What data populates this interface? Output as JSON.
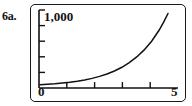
{
  "figure": {
    "problem_label": "6a."
  },
  "chart_data": {
    "type": "line",
    "title": "",
    "subtitle": "",
    "xlabel": "",
    "ylabel": "",
    "xlim": [
      0,
      5
    ],
    "ylim": [
      0,
      1000
    ],
    "grid": false,
    "legend": null,
    "annotations": [],
    "axis_labels": {
      "y_max": "1,000",
      "x_min": "0",
      "x_max": "5"
    },
    "x_ticks": [
      1,
      2,
      3,
      4
    ],
    "x_tick_labels": [
      "",
      "",
      "",
      ""
    ],
    "y_ticks": [
      200,
      400,
      600,
      800,
      1000
    ],
    "y_tick_labels": [
      "",
      "",
      "",
      "",
      "1,000"
    ],
    "series": [
      {
        "name": "exponential growth",
        "x": [
          0,
          0.25,
          0.5,
          0.75,
          1.0,
          1.25,
          1.5,
          1.75,
          2.0,
          2.25,
          2.5,
          2.75,
          3.0,
          3.25,
          3.5,
          3.75,
          4.0,
          4.15,
          4.3
        ],
        "values": [
          18,
          23,
          28,
          35,
          43,
          54,
          67,
          83,
          103,
          128,
          158,
          196,
          243,
          301,
          373,
          462,
          573,
          653,
          744
        ]
      }
    ],
    "curve_exits_top": true,
    "stroke_color": "#111111"
  }
}
